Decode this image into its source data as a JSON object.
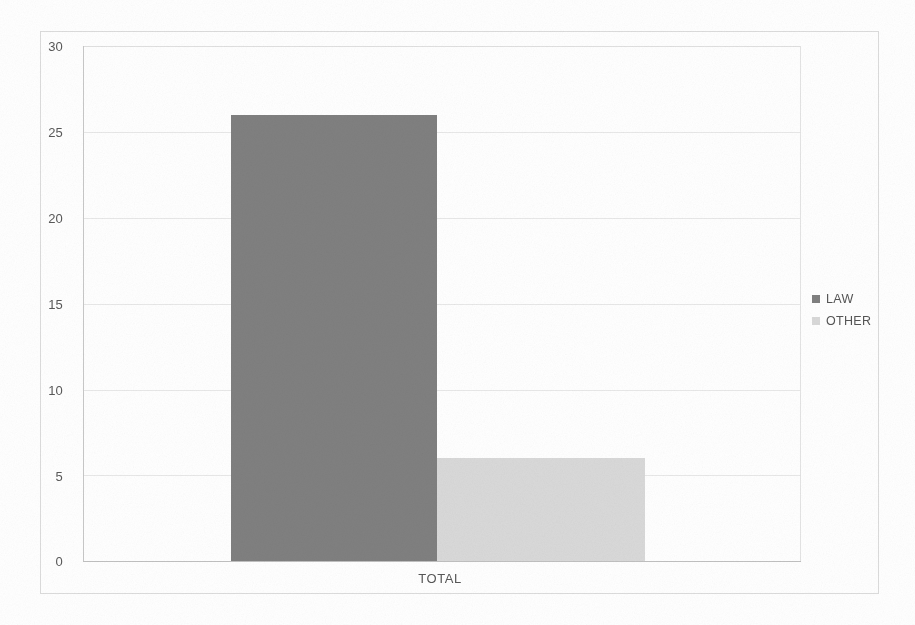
{
  "chart_data": {
    "type": "bar",
    "subtype": "stacked-horizontal-segments",
    "title": "",
    "subtitle": "",
    "xlabel": "",
    "ylabel": "",
    "categories": [
      "TOTAL"
    ],
    "series": [
      {
        "name": "LAW",
        "values": [
          26
        ],
        "color": "#808080"
      },
      {
        "name": "OTHER",
        "values": [
          6
        ],
        "color": "#d9d9d9"
      }
    ],
    "ylim": [
      0,
      30
    ],
    "ytick_step": 5,
    "ytick_labels": [
      "0",
      "5",
      "10",
      "15",
      "20",
      "25",
      "30"
    ],
    "xtick_labels": [
      "TOTAL"
    ],
    "grid": true,
    "grid_axis": "y",
    "legend": true,
    "legend_position": "right",
    "legend_entries": [
      "LAW",
      "OTHER"
    ]
  },
  "axis": {
    "y_labels": [
      "30",
      "25",
      "20",
      "15",
      "10",
      "5",
      "0"
    ],
    "x_category": "TOTAL"
  },
  "legend": {
    "items": [
      {
        "label": "LAW",
        "color": "#808080"
      },
      {
        "label": "OTHER",
        "color": "#d9d9d9"
      }
    ]
  },
  "colors": {
    "law": "#808080",
    "other": "#d9d9d9",
    "gridline": "#e8e8e8",
    "frame": "#dcdcdc",
    "axis": "#c0c0c0",
    "text": "#575757",
    "background": "#ffffff"
  }
}
